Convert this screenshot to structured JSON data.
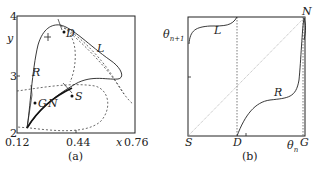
{
  "panel_a": {
    "caption": "(a)",
    "x_axis": {
      "label": "x",
      "ticks": [
        "0.12",
        "0.44",
        "0.76"
      ]
    },
    "y_axis": {
      "label": "y",
      "ticks": [
        "2",
        "3",
        "4"
      ]
    },
    "curve_labels": {
      "L": "L",
      "R": "R"
    },
    "points": {
      "D": "D",
      "S": "S",
      "G": "G",
      "N": "N"
    }
  },
  "panel_b": {
    "caption": "(b)",
    "y_label": "θ",
    "y_label_sub": "n+1",
    "x_label": "θ",
    "x_label_sub": "n",
    "corner_labels": {
      "S": "S",
      "D": "D",
      "G": "G",
      "N": "N"
    },
    "curve_labels": {
      "L": "L",
      "R": "R"
    }
  },
  "colors": {
    "ink": "#222222",
    "dashed": "#444444",
    "diagonal": "#999999"
  }
}
